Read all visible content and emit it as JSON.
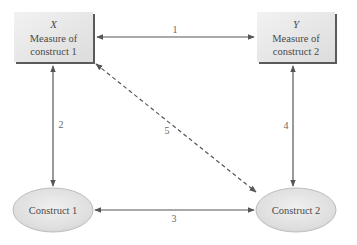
{
  "diagram": {
    "nodes": {
      "x_box": {
        "variable": "X",
        "line1": "Measure of",
        "line2": "construct 1"
      },
      "y_box": {
        "variable": "Y",
        "line1": "Measure of",
        "line2": "construct 2"
      },
      "construct1": {
        "label": "Construct 1"
      },
      "construct2": {
        "label": "Construct 2"
      }
    },
    "edges": [
      {
        "id": "1",
        "label": "1",
        "from": "X",
        "to": "Y",
        "style": "solid",
        "direction": "bidirectional"
      },
      {
        "id": "2",
        "label": "2",
        "from": "X",
        "to": "Construct 1",
        "style": "solid",
        "direction": "bidirectional"
      },
      {
        "id": "3",
        "label": "3",
        "from": "Construct 1",
        "to": "Construct 2",
        "style": "solid",
        "direction": "bidirectional"
      },
      {
        "id": "4",
        "label": "4",
        "from": "Y",
        "to": "Construct 2",
        "style": "solid",
        "direction": "bidirectional"
      },
      {
        "id": "5",
        "label": "5",
        "from": "X",
        "to": "Construct 2",
        "style": "dashed",
        "direction": "bidirectional"
      }
    ],
    "colors": {
      "box_fill": "#e6e6e6",
      "box_shadow": "#5a5a5a",
      "ellipse_fill": "#e2e2e2",
      "line": "#555555",
      "text": "#4a4a4a"
    }
  }
}
